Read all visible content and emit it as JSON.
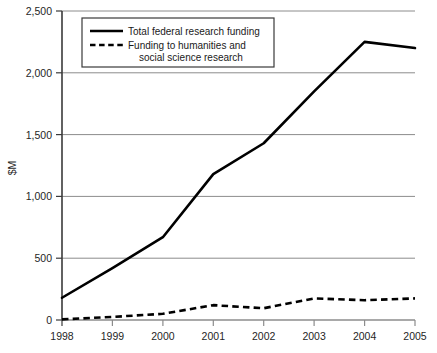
{
  "figure": {
    "caption_fragment": ""
  },
  "chart_data": {
    "type": "line",
    "title": "",
    "xlabel": "",
    "ylabel": "$M",
    "x": [
      "1998",
      "1999",
      "2000",
      "2001",
      "2002",
      "2003",
      "2004",
      "2005"
    ],
    "categories": [
      "1998",
      "1999",
      "2000",
      "2001",
      "2002",
      "2003",
      "2004",
      "2005"
    ],
    "xlim": [
      1998,
      2005
    ],
    "ylim": [
      0,
      2500
    ],
    "yticks": [
      0,
      500,
      1000,
      1500,
      2000,
      2500
    ],
    "ytick_labels": [
      "0",
      "500",
      "1,000",
      "1,500",
      "2,000",
      "2,500"
    ],
    "xtick_labels": [
      "1998",
      "1999",
      "2000",
      "2001",
      "2002",
      "2003",
      "2004",
      "2005"
    ],
    "grid": true,
    "grid_axis": "y",
    "legend_position": "upper left",
    "series": [
      {
        "name": "Total federal research funding",
        "style": "solid",
        "color": "#000000",
        "values": [
          180,
          420,
          670,
          1180,
          1430,
          1850,
          2250,
          2200
        ]
      },
      {
        "name": "Funding to humanities and social science research",
        "style": "dashed",
        "color": "#000000",
        "values": [
          5,
          25,
          50,
          120,
          95,
          175,
          160,
          175
        ]
      }
    ]
  },
  "legend": {
    "entries": [
      {
        "label": "Total federal research funding",
        "label_line2": ""
      },
      {
        "label": "Funding to humanities and",
        "label_line2": "social science research"
      }
    ]
  },
  "colors": {
    "line": "#000000",
    "grid": "#8c8c8c",
    "axis": "#3a3a3a",
    "background": "#ffffff"
  }
}
